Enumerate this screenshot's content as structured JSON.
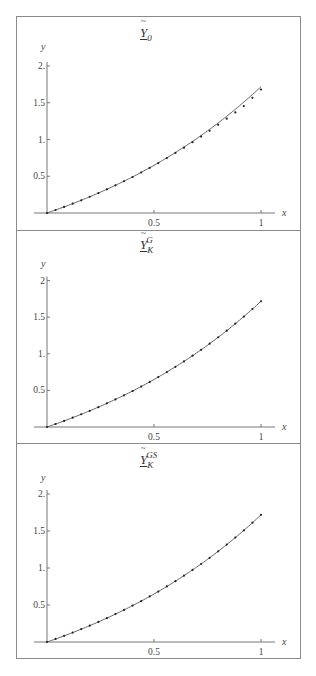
{
  "chart_data": [
    {
      "type": "line",
      "title": "Ỹ_0",
      "title_parts": {
        "base": "Y",
        "sub": "0",
        "sup": ""
      },
      "xlabel": "x",
      "ylabel": "y",
      "xlim": [
        0,
        1
      ],
      "ylim": [
        0,
        2
      ],
      "x_ticks": [
        0.5,
        1
      ],
      "x_tick_labels": [
        "0.5",
        "1"
      ],
      "y_ticks": [
        0.5,
        1,
        1.5,
        2
      ],
      "y_tick_labels": [
        "0.5",
        "1.",
        "1.5",
        "2."
      ],
      "grid": false,
      "series": [
        {
          "name": "exact",
          "style": "line",
          "function": "exp(x)-1"
        },
        {
          "name": "approx",
          "style": "dots",
          "x": [
            0,
            0.04,
            0.08,
            0.12,
            0.16,
            0.2,
            0.24,
            0.28,
            0.32,
            0.36,
            0.4,
            0.44,
            0.48,
            0.52,
            0.56,
            0.6,
            0.64,
            0.68,
            0.72,
            0.76,
            0.8,
            0.84,
            0.88,
            0.92,
            0.96,
            1.0
          ],
          "values": [
            0,
            0.041,
            0.083,
            0.127,
            0.173,
            0.221,
            0.271,
            0.322,
            0.376,
            0.432,
            0.49,
            0.551,
            0.614,
            0.679,
            0.747,
            0.817,
            0.889,
            0.963,
            1.04,
            1.119,
            1.2,
            1.283,
            1.368,
            1.455,
            1.567,
            1.68
          ]
        }
      ]
    },
    {
      "type": "line",
      "title": "Ỹ_K^G",
      "title_parts": {
        "base": "Y",
        "sub": "K",
        "sup": "G"
      },
      "xlabel": "x",
      "ylabel": "y",
      "xlim": [
        0,
        1
      ],
      "ylim": [
        0,
        2
      ],
      "x_ticks": [
        0.5,
        1
      ],
      "x_tick_labels": [
        "0.5",
        "1"
      ],
      "y_ticks": [
        0.5,
        1,
        1.5,
        2
      ],
      "y_tick_labels": [
        "0.5",
        "1.",
        "1.5",
        "2"
      ],
      "grid": false,
      "series": [
        {
          "name": "exact",
          "style": "line",
          "function": "exp(x)-1"
        },
        {
          "name": "approx",
          "style": "dots",
          "x": [
            0,
            0.04,
            0.08,
            0.12,
            0.16,
            0.2,
            0.24,
            0.28,
            0.32,
            0.36,
            0.4,
            0.44,
            0.48,
            0.52,
            0.56,
            0.6,
            0.64,
            0.68,
            0.72,
            0.76,
            0.8,
            0.84,
            0.88,
            0.92,
            0.96,
            1.0
          ],
          "values": [
            0,
            0.041,
            0.083,
            0.127,
            0.174,
            0.221,
            0.271,
            0.323,
            0.377,
            0.433,
            0.492,
            0.553,
            0.616,
            0.682,
            0.751,
            0.822,
            0.896,
            0.974,
            1.054,
            1.138,
            1.226,
            1.316,
            1.411,
            1.509,
            1.612,
            1.718
          ]
        }
      ]
    },
    {
      "type": "line",
      "title": "Ỹ_K^GS",
      "title_parts": {
        "base": "Y",
        "sub": "K",
        "sup": "GS"
      },
      "xlabel": "x",
      "ylabel": "y",
      "xlim": [
        0,
        1
      ],
      "ylim": [
        0,
        2
      ],
      "x_ticks": [
        0.5,
        1
      ],
      "x_tick_labels": [
        "0.5",
        "1"
      ],
      "y_ticks": [
        0.5,
        1,
        1.5,
        2
      ],
      "y_tick_labels": [
        "0.5",
        "1.",
        "1.5",
        "2."
      ],
      "grid": false,
      "series": [
        {
          "name": "exact",
          "style": "line",
          "function": "exp(x)-1"
        },
        {
          "name": "approx",
          "style": "dots",
          "x": [
            0,
            0.04,
            0.08,
            0.12,
            0.16,
            0.2,
            0.24,
            0.28,
            0.32,
            0.36,
            0.4,
            0.44,
            0.48,
            0.52,
            0.56,
            0.6,
            0.64,
            0.68,
            0.72,
            0.76,
            0.8,
            0.84,
            0.88,
            0.92,
            0.96,
            1.0
          ],
          "values": [
            0,
            0.041,
            0.083,
            0.127,
            0.174,
            0.221,
            0.271,
            0.323,
            0.377,
            0.433,
            0.492,
            0.553,
            0.616,
            0.682,
            0.751,
            0.822,
            0.896,
            0.974,
            1.054,
            1.138,
            1.226,
            1.316,
            1.411,
            1.509,
            1.612,
            1.718
          ]
        }
      ]
    }
  ],
  "panels": [
    {
      "title_base": "Y",
      "title_sub": "0",
      "title_sup": ""
    },
    {
      "title_base": "Y",
      "title_sub": "K",
      "title_sup": "G"
    },
    {
      "title_base": "Y",
      "title_sub": "K",
      "title_sup": "GS"
    }
  ],
  "colors": {
    "frame": "#8a8a8a",
    "axis": "#777777",
    "curve": "#555555",
    "dots": "#222222"
  }
}
